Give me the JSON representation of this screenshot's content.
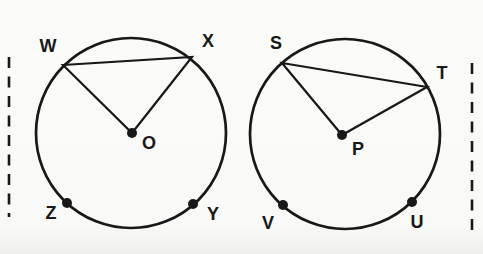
{
  "canvas": {
    "width": 483,
    "height": 254,
    "background": "#fafaf8",
    "ink_color": "#181818"
  },
  "diagram": {
    "style": {
      "circle_stroke_width": 2.7,
      "segment_stroke_width": 2.2,
      "dot_radius": 5,
      "label_font_size": 18,
      "dash_stroke_width": 2.6,
      "dash_pattern": "11 8.5"
    },
    "figures": [
      {
        "name": "circle-O",
        "circle": {
          "cx": 131,
          "cy": 133,
          "r": 95
        },
        "triangle": {
          "points": "63,65 192,57 132,133"
        },
        "dots": [
          {
            "name": "point-O",
            "x": 132,
            "y": 133
          },
          {
            "name": "point-Z",
            "x": 67,
            "y": 203
          },
          {
            "name": "point-Y",
            "x": 193,
            "y": 204
          }
        ],
        "labels": [
          {
            "text": "W",
            "x": 48,
            "y": 47
          },
          {
            "text": "X",
            "x": 208,
            "y": 42
          },
          {
            "text": "O",
            "x": 149,
            "y": 144
          },
          {
            "text": "Z",
            "x": 51,
            "y": 214
          },
          {
            "text": "Y",
            "x": 213,
            "y": 215
          }
        ]
      },
      {
        "name": "circle-P",
        "circle": {
          "cx": 345,
          "cy": 134,
          "r": 95
        },
        "triangle": {
          "points": "282,63 427,87 342,135"
        },
        "dots": [
          {
            "name": "point-P",
            "x": 342,
            "y": 135
          },
          {
            "name": "point-V",
            "x": 283,
            "y": 205
          },
          {
            "name": "point-U",
            "x": 412,
            "y": 202
          }
        ],
        "labels": [
          {
            "text": "S",
            "x": 276,
            "y": 44
          },
          {
            "text": "T",
            "x": 442,
            "y": 74
          },
          {
            "text": "P",
            "x": 358,
            "y": 150
          },
          {
            "text": "V",
            "x": 268,
            "y": 224
          },
          {
            "text": "U",
            "x": 417,
            "y": 223
          }
        ]
      }
    ],
    "dashed_lines": [
      {
        "name": "left-margin-dashed-line",
        "x": 9,
        "y1": 57,
        "y2": 217
      },
      {
        "name": "right-margin-dashed-line",
        "x": 472,
        "y1": 63,
        "y2": 235
      }
    ]
  }
}
